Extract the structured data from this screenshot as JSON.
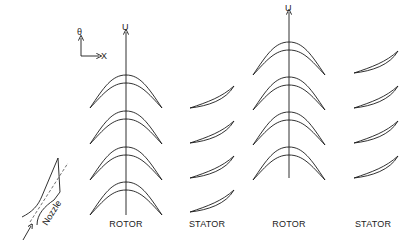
{
  "axes": {
    "theta_label": "θ",
    "x_label": "X",
    "rotor_velocity_label": "U"
  },
  "nozzle": {
    "label": "Nozzle"
  },
  "stages": [
    {
      "label": "ROTOR",
      "type": "rotor",
      "center_x": 126
    },
    {
      "label": "STATOR",
      "type": "stator",
      "center_x": 207
    },
    {
      "label": "ROTOR",
      "type": "rotor",
      "center_x": 289
    },
    {
      "label": "STATOR",
      "type": "stator",
      "center_x": 373
    }
  ],
  "colors": {
    "line": "#1a1a1a",
    "background": "#ffffff"
  }
}
